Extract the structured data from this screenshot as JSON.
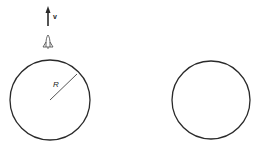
{
  "diagram": {
    "velocity_label": "v",
    "radius_label": "R",
    "left_circle": {
      "cx": 50,
      "cy": 100,
      "r": 40
    },
    "right_circle": {
      "cx": 211,
      "cy": 100,
      "r": 39
    },
    "stroke_color": "#2a2a2a",
    "icons": [
      "velocity-arrow-icon",
      "rocket-icon"
    ]
  }
}
